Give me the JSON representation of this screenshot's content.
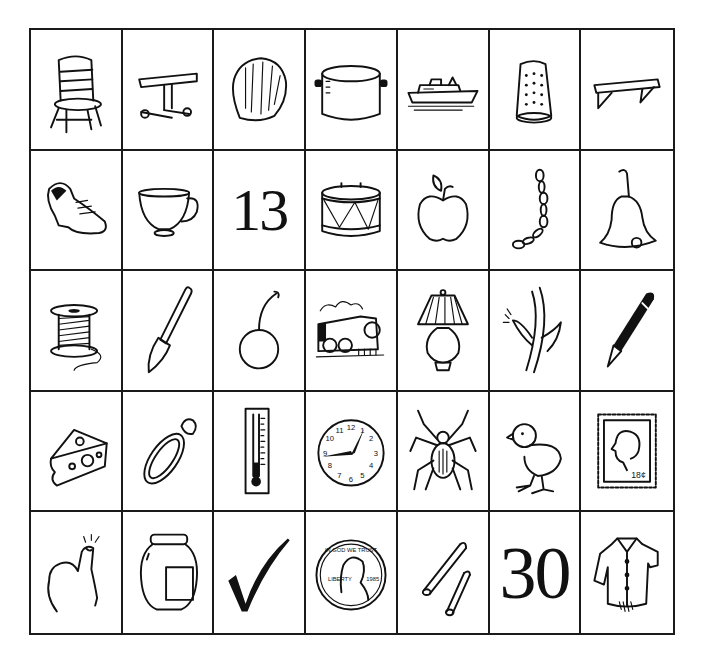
{
  "worksheet": {
    "grid": {
      "columns": 7,
      "rows": 5,
      "cells": [
        [
          {
            "type": "picture",
            "label": "chair",
            "icon": "chair-icon"
          },
          {
            "type": "picture",
            "label": "bench",
            "icon": "bench-icon"
          },
          {
            "type": "picture",
            "label": "shell",
            "icon": "shell-icon"
          },
          {
            "type": "picture",
            "label": "pot",
            "icon": "pot-icon"
          },
          {
            "type": "picture",
            "label": "ship",
            "icon": "ship-icon"
          },
          {
            "type": "picture",
            "label": "thimble",
            "icon": "thimble-icon"
          },
          {
            "type": "picture",
            "label": "shelf",
            "icon": "shelf-icon"
          }
        ],
        [
          {
            "type": "picture",
            "label": "shoe",
            "icon": "shoe-icon"
          },
          {
            "type": "picture",
            "label": "cup",
            "icon": "cup-icon"
          },
          {
            "type": "number",
            "label": "13",
            "text": "13"
          },
          {
            "type": "picture",
            "label": "drum",
            "icon": "drum-icon"
          },
          {
            "type": "picture",
            "label": "apple",
            "icon": "apple-icon"
          },
          {
            "type": "picture",
            "label": "chain",
            "icon": "chain-icon"
          },
          {
            "type": "picture",
            "label": "bell",
            "icon": "bell-icon"
          }
        ],
        [
          {
            "type": "picture",
            "label": "thread spool",
            "icon": "spool-icon"
          },
          {
            "type": "picture",
            "label": "shovel",
            "icon": "shovel-icon"
          },
          {
            "type": "picture",
            "label": "cherry",
            "icon": "cherry-icon"
          },
          {
            "type": "picture",
            "label": "train",
            "icon": "train-icon"
          },
          {
            "type": "picture",
            "label": "lamp",
            "icon": "lamp-icon"
          },
          {
            "type": "picture",
            "label": "thorn",
            "icon": "thorn-icon"
          },
          {
            "type": "picture",
            "label": "pen",
            "icon": "pen-icon"
          }
        ],
        [
          {
            "type": "picture",
            "label": "cheese",
            "icon": "cheese-icon"
          },
          {
            "type": "picture",
            "label": "ring",
            "icon": "ring-icon"
          },
          {
            "type": "picture",
            "label": "thermometer",
            "icon": "thermometer-icon"
          },
          {
            "type": "picture",
            "label": "clock",
            "icon": "clock-icon"
          },
          {
            "type": "picture",
            "label": "spider",
            "icon": "spider-icon"
          },
          {
            "type": "picture",
            "label": "chick",
            "icon": "chick-icon"
          },
          {
            "type": "picture",
            "label": "stamp",
            "icon": "stamp-icon",
            "stamp_value": "18¢"
          }
        ],
        [
          {
            "type": "picture",
            "label": "thumb",
            "icon": "thumb-icon"
          },
          {
            "type": "picture",
            "label": "jar",
            "icon": "jar-icon"
          },
          {
            "type": "picture",
            "label": "check mark",
            "icon": "checkmark-icon"
          },
          {
            "type": "picture",
            "label": "penny",
            "icon": "penny-icon",
            "coin_text": [
              "IN GOD WE TRUST",
              "LIBERTY",
              "1985"
            ]
          },
          {
            "type": "picture",
            "label": "straws",
            "icon": "straws-icon"
          },
          {
            "type": "number",
            "label": "30",
            "text": "30"
          },
          {
            "type": "picture",
            "label": "shirt",
            "icon": "shirt-icon"
          }
        ]
      ]
    },
    "colors": {
      "line": "#1a1a1a",
      "background": "#ffffff"
    }
  }
}
